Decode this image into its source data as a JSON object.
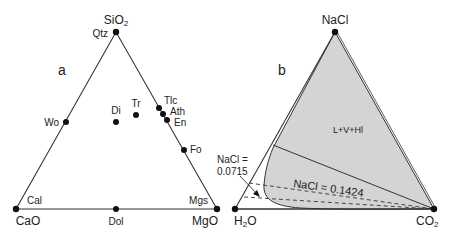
{
  "panel_a": {
    "letter": "a",
    "vertices": {
      "top": {
        "label": "SiO",
        "sub": "2",
        "mineral": "Qtz"
      },
      "left": {
        "label": "CaO",
        "mineral": "Cal"
      },
      "right": {
        "label": "MgO",
        "mineral": "Mgs"
      }
    },
    "points": [
      {
        "label": "Wo"
      },
      {
        "label": "Di"
      },
      {
        "label": "Tr"
      },
      {
        "label": "Tlc"
      },
      {
        "label": "Ath"
      },
      {
        "label": "En"
      },
      {
        "label": "Fo"
      },
      {
        "label": "Dol"
      }
    ]
  },
  "panel_b": {
    "letter": "b",
    "vertices": {
      "top": {
        "label": "NaCl"
      },
      "left": {
        "label": "H",
        "sub": "2",
        "tail": "O"
      },
      "right": {
        "label": "CO",
        "sub": "2"
      }
    },
    "region_label": "L+V+Hl",
    "annotation_1": {
      "line1": "NaCl =",
      "line2": "0.0715"
    },
    "annotation_2": "NaCl = 0.1424",
    "colors": {
      "fill": "#d4d4d4",
      "line": "#333333"
    }
  }
}
